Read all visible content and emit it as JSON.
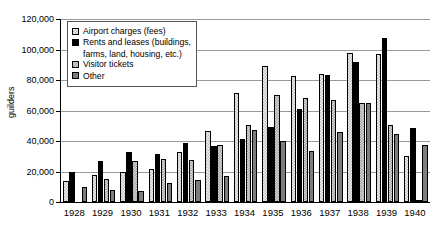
{
  "chart_data": {
    "type": "bar",
    "title": "",
    "xlabel": "",
    "ylabel": "guilders",
    "ylim": [
      0,
      120000
    ],
    "ytick_labels": [
      "120,000",
      "100,000",
      "80,000",
      "60,000",
      "40,000",
      "20,000",
      "0"
    ],
    "ytick_values": [
      120000,
      100000,
      80000,
      60000,
      40000,
      20000,
      0
    ],
    "grid": true,
    "legend_position": "top-left",
    "categories": [
      "1928",
      "1929",
      "1930",
      "1931",
      "1932",
      "1933",
      "1934",
      "1935",
      "1936",
      "1937",
      "1938",
      "1939",
      "1940"
    ],
    "series": [
      {
        "name": "Airport charges (fees)",
        "swatch": "#efefef",
        "values": [
          13800,
          17800,
          19600,
          21800,
          33000,
          46300,
          71500,
          89200,
          82600,
          83700,
          97600,
          97000,
          30300
        ]
      },
      {
        "name": "Rents and leases (buildings, farms, land, housing, etc.)",
        "swatch": "#000000",
        "values": [
          20000,
          26800,
          33000,
          31200,
          38400,
          36800,
          41300,
          49000,
          61200,
          83600,
          91700,
          107400,
          48400
        ]
      },
      {
        "name": "Visitor tickets",
        "swatch": "#dcdcdc",
        "values": [
          null,
          15200,
          26800,
          28300,
          27400,
          37500,
          50600,
          70200,
          68200,
          66800,
          64700,
          50600,
          1500
        ]
      },
      {
        "name": "Other",
        "swatch": "#7d7d7d",
        "values": [
          9800,
          8000,
          7400,
          12700,
          14500,
          17200,
          46900,
          40200,
          33600,
          45700,
          64800,
          44700,
          37300
        ]
      }
    ]
  },
  "legend": {
    "items": [
      {
        "label": "Airport charges (fees)",
        "continuation": ""
      },
      {
        "label": "Rents and leases (buildings,",
        "continuation": "farms, land, housing, etc.)"
      },
      {
        "label": "Visitor tickets",
        "continuation": ""
      },
      {
        "label": "Other",
        "continuation": ""
      }
    ]
  }
}
